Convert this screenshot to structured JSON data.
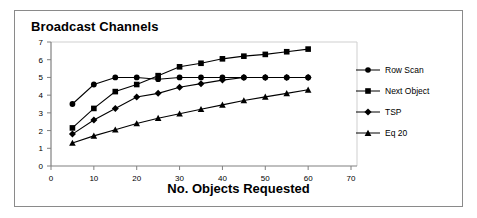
{
  "figure": {
    "title": "Broadcast Channels"
  },
  "chart_data": {
    "type": "line",
    "title": "Broadcast Channels",
    "xlabel": "No. Objects Requested",
    "ylabel": "",
    "xlim": [
      0,
      70
    ],
    "ylim": [
      0,
      7
    ],
    "xticks": [
      0,
      10,
      20,
      30,
      40,
      50,
      60,
      70
    ],
    "yticks": [
      0,
      1,
      2,
      3,
      4,
      5,
      6,
      7
    ],
    "grid": false,
    "legend_position": "right",
    "x": [
      5,
      10,
      15,
      20,
      25,
      30,
      35,
      40,
      45,
      50,
      55,
      60
    ],
    "series": [
      {
        "name": "Row Scan",
        "marker": "circle",
        "color": "#000000",
        "values": [
          3.5,
          4.6,
          5.0,
          5.0,
          4.9,
          5.0,
          5.0,
          5.0,
          5.0,
          5.0,
          5.0,
          5.0
        ]
      },
      {
        "name": "Next Object",
        "marker": "square",
        "color": "#000000",
        "values": [
          2.15,
          3.25,
          4.2,
          4.6,
          5.1,
          5.6,
          5.8,
          6.05,
          6.2,
          6.3,
          6.45,
          6.6
        ]
      },
      {
        "name": "TSP",
        "marker": "diamond",
        "color": "#000000",
        "values": [
          1.8,
          2.6,
          3.25,
          3.9,
          4.1,
          4.45,
          4.65,
          4.85,
          5.0,
          5.0,
          5.0,
          5.0
        ]
      },
      {
        "name": "Eq  20",
        "marker": "triangle",
        "color": "#000000",
        "values": [
          1.3,
          1.7,
          2.05,
          2.4,
          2.7,
          2.95,
          3.2,
          3.45,
          3.7,
          3.9,
          4.1,
          4.3
        ]
      }
    ]
  },
  "legend": {
    "items": [
      {
        "label": "Row Scan",
        "marker": "circle"
      },
      {
        "label": "Next Object",
        "marker": "square"
      },
      {
        "label": "TSP",
        "marker": "diamond"
      },
      {
        "label": "Eq  20",
        "marker": "triangle"
      }
    ]
  },
  "axes": {
    "x_title": "No. Objects Requested"
  },
  "colors": {
    "line": "#000000",
    "axis": "#808080",
    "frame": "#8a8a8a",
    "background": "#ffffff"
  }
}
